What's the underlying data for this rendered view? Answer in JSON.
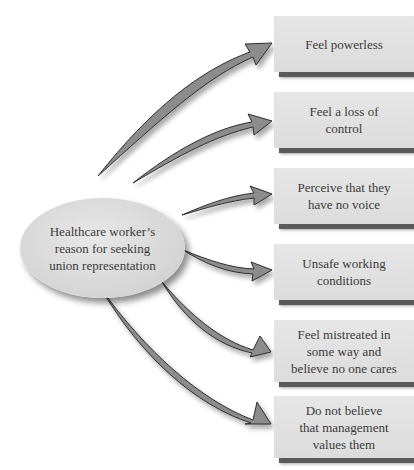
{
  "center": {
    "lines": [
      "Healthcare worker’s",
      "reason for seeking",
      "union representation"
    ]
  },
  "reasons": [
    {
      "lines": [
        "Feel powerless"
      ]
    },
    {
      "lines": [
        "Feel a loss of",
        "control"
      ]
    },
    {
      "lines": [
        "Perceive that they",
        "have no voice"
      ]
    },
    {
      "lines": [
        "Unsafe working",
        "conditions"
      ]
    },
    {
      "lines": [
        "Feel mistreated in",
        "some way and",
        "believe no one cares"
      ]
    },
    {
      "lines": [
        "Do not believe",
        "that management",
        "values them"
      ]
    }
  ],
  "colors": {
    "arrow_fill": "#8c8c8c",
    "arrow_edge": "#2e2e2e",
    "box_fill": "#e2e2e2",
    "box_shadow": "#5a5a5a",
    "text": "#3a3a3a"
  }
}
